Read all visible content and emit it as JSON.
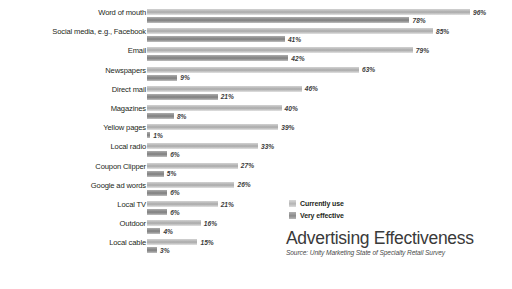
{
  "chart_data": {
    "type": "bar",
    "orientation": "horizontal",
    "title": "Advertising Effectiveness",
    "subtitle": "Source: Unity Marketing State of Specialty Retail Survey",
    "xlabel": "",
    "ylabel": "",
    "xlim": [
      0,
      100
    ],
    "grid": false,
    "legend_position": "right",
    "value_suffix": "%",
    "categories": [
      "Word of mouth",
      "Social media, e.g., Facebook",
      "Email",
      "Newspapers",
      "Direct mail",
      "Magazines",
      "Yellow pages",
      "Local radio",
      "Coupon Clipper",
      "Google ad words",
      "Local TV",
      "Outdoor",
      "Local cable"
    ],
    "series": [
      {
        "name": "Currently use",
        "color": "#bdbdbd",
        "values": [
          96,
          85,
          79,
          63,
          46,
          40,
          39,
          33,
          27,
          26,
          21,
          16,
          15
        ],
        "labels": [
          "96%",
          "85%",
          "79%",
          "63%",
          "46%",
          "40%",
          "39%",
          "33%",
          "27%",
          "26%",
          "21%",
          "16%",
          "15%"
        ]
      },
      {
        "name": "Very effective",
        "color": "#8c8c8c",
        "values": [
          78,
          41,
          42,
          9,
          21,
          8,
          1,
          6,
          5,
          6,
          6,
          4,
          3
        ],
        "labels": [
          "78%",
          "41%",
          "42%",
          "9%",
          "21%",
          "8%",
          "1%",
          "6%",
          "5%",
          "6%",
          "6%",
          "4%",
          "3%"
        ]
      }
    ]
  },
  "legend": {
    "items": [
      {
        "label": "Currently use"
      },
      {
        "label": "Very effective"
      }
    ]
  }
}
